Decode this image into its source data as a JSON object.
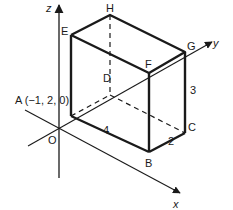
{
  "diagram": {
    "type": "3d-cuboid-on-axes",
    "axes": {
      "x": {
        "label": "x"
      },
      "y": {
        "label": "y"
      },
      "z": {
        "label": "z"
      },
      "origin": {
        "label": "O"
      }
    },
    "vertices": {
      "A": {
        "label": "A (−1, 2, 0)"
      },
      "B": {
        "label": "B"
      },
      "C": {
        "label": "C"
      },
      "D": {
        "label": "D"
      },
      "E": {
        "label": "E"
      },
      "F": {
        "label": "F"
      },
      "G": {
        "label": "G"
      },
      "H": {
        "label": "H"
      }
    },
    "dimensions": {
      "AB": "4",
      "BC": "2",
      "CG": "3"
    },
    "colors": {
      "line": "#1a1a1a",
      "background": "#ffffff"
    }
  }
}
